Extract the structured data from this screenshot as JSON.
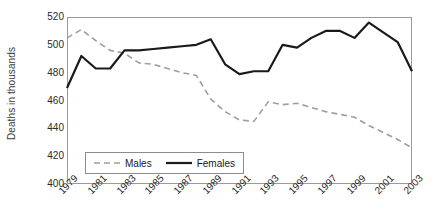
{
  "chart_data": {
    "type": "line",
    "title": "",
    "xlabel": "",
    "ylabel": "Deaths in thousands",
    "ylim": [
      400,
      520
    ],
    "xlim": [
      1979,
      2003
    ],
    "yticks": [
      400,
      420,
      440,
      460,
      480,
      500,
      520
    ],
    "xticks": [
      1979,
      1981,
      1983,
      1985,
      1987,
      1989,
      1991,
      1993,
      1995,
      1997,
      1999,
      2001,
      2003
    ],
    "grid": false,
    "legend_position": "lower-left-inside",
    "x": [
      1979,
      1980,
      1981,
      1982,
      1983,
      1984,
      1985,
      1986,
      1987,
      1988,
      1989,
      1990,
      1991,
      1992,
      1993,
      1994,
      1995,
      1996,
      1997,
      1998,
      1999,
      2000,
      2001,
      2002,
      2003
    ],
    "series": [
      {
        "name": "Males",
        "color": "#9e9e9e",
        "style": "dashed",
        "values": [
          505,
          511,
          503,
          496,
          494,
          487,
          486,
          483,
          480,
          478,
          461,
          452,
          446,
          445,
          459,
          457,
          458,
          455,
          452,
          450,
          448,
          442,
          437,
          432,
          426
        ]
      },
      {
        "name": "Females",
        "color": "#1a1a1a",
        "style": "solid",
        "values": [
          469,
          492,
          483,
          483,
          496,
          496,
          497,
          498,
          499,
          500,
          504,
          486,
          479,
          481,
          481,
          500,
          498,
          505,
          510,
          510,
          505,
          516,
          509,
          502,
          481
        ]
      }
    ]
  },
  "axis": {
    "ylabel": "Deaths in thousands",
    "ytick_labels": [
      "520",
      "500",
      "480",
      "460",
      "440",
      "420",
      "400"
    ],
    "xtick_labels": [
      "1979",
      "1981",
      "1983",
      "1985",
      "1987",
      "1989",
      "1991",
      "1993",
      "1995",
      "1997",
      "1999",
      "2001",
      "2003"
    ]
  },
  "legend": {
    "items": [
      {
        "label": "Males",
        "icon": "dashed-line-icon"
      },
      {
        "label": "Females",
        "icon": "solid-line-icon"
      }
    ]
  }
}
